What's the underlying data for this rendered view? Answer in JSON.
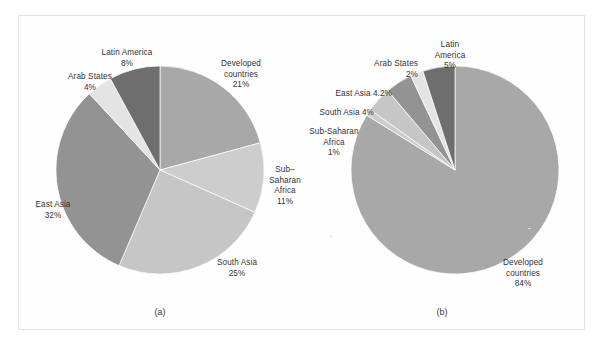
{
  "figure": {
    "background_color": "#ffffff",
    "frame_color": "#e2e2e2"
  },
  "panels": [
    {
      "id": "a",
      "caption": "(a)",
      "labels": [
        {
          "name": "latin-america",
          "text": "Latin America\n8%"
        },
        {
          "name": "arab-states",
          "text": "Arab States\n4%"
        },
        {
          "name": "east-asia",
          "text": "East Asia\n32%"
        },
        {
          "name": "south-asia",
          "text": "South Asia\n25%"
        },
        {
          "name": "sub-saharan-africa",
          "text": "Sub–\nSaharan\nAfrica\n11%"
        },
        {
          "name": "developed-countries",
          "text": "Developed\ncountries\n21%"
        }
      ]
    },
    {
      "id": "b",
      "caption": "(b)",
      "labels": [
        {
          "name": "latin-america",
          "text": "Latin\nAmerica\n5%"
        },
        {
          "name": "arab-states",
          "text": "Arab States\n2%"
        },
        {
          "name": "east-asia",
          "text": "East Asia 4.2%"
        },
        {
          "name": "south-asia",
          "text": "South Asia 4%"
        },
        {
          "name": "sub-saharan-africa",
          "text": "Sub-Saharan\nAfrica\n1%"
        },
        {
          "name": "developed-countries",
          "text": "Developed\ncountries\n84%"
        }
      ]
    }
  ],
  "chart_data": [
    {
      "type": "pie",
      "title": "(a)",
      "labels": [
        "Developed countries",
        "Sub–Saharan Africa",
        "South Asia",
        "East Asia",
        "Arab States",
        "Latin America"
      ],
      "values": [
        21,
        11,
        25,
        32,
        4,
        8
      ],
      "value_unit": "%",
      "colors": [
        "#a8a8a8",
        "#cdcdcd",
        "#c6c6c6",
        "#939393",
        "#e4e4e4",
        "#6e6e6e"
      ],
      "start_angle_deg": 0,
      "direction": "clockwise",
      "legend": "none",
      "labels_position": "outside"
    },
    {
      "type": "pie",
      "title": "(b)",
      "labels": [
        "Developed countries",
        "Sub-Saharan Africa",
        "South Asia",
        "East Asia",
        "Arab States",
        "Latin America"
      ],
      "values": [
        84,
        1,
        4,
        4.2,
        2,
        5
      ],
      "value_unit": "%",
      "colors": [
        "#a8a8a8",
        "#cdcdcd",
        "#c6c6c6",
        "#939393",
        "#e4e4e4",
        "#6e6e6e"
      ],
      "start_angle_deg": 0,
      "direction": "clockwise",
      "legend": "none",
      "labels_position": "outside"
    }
  ]
}
